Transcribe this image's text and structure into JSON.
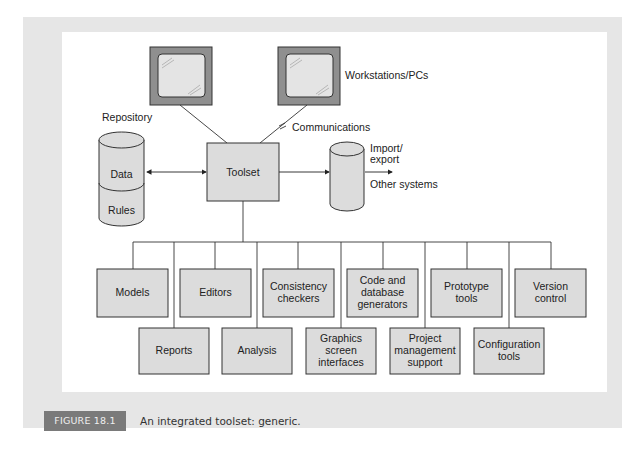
{
  "figure": {
    "badge": "FIGURE 18.1",
    "caption": "An integrated toolset: generic."
  },
  "diagram": {
    "workstations_label": "Workstations/PCs",
    "communications_label": "Communications",
    "repository_label": "Repository",
    "repository_sections": [
      "Data",
      "Rules"
    ],
    "toolset_label": "Toolset",
    "import_export_label_1": "Import/",
    "import_export_label_2": "export",
    "other_systems_label": "Other systems",
    "top_row_tools": [
      [
        "Models"
      ],
      [
        "Editors"
      ],
      [
        "Consistency",
        "checkers"
      ],
      [
        "Code and",
        "database",
        "generators"
      ],
      [
        "Prototype",
        "tools"
      ],
      [
        "Version",
        "control"
      ]
    ],
    "bottom_row_tools": [
      [
        "Reports"
      ],
      [
        "Analysis"
      ],
      [
        "Graphics",
        "screen",
        "interfaces"
      ],
      [
        "Project",
        "management",
        "support"
      ],
      [
        "Configuration",
        "tools"
      ]
    ],
    "colors": {
      "box_fill": "#dcdcdc",
      "monitor_frame": "#8f8f8f",
      "screen": "#e4e4e4",
      "caption_badge": "#7a7a7a",
      "panel": "#e6e6e6"
    }
  }
}
